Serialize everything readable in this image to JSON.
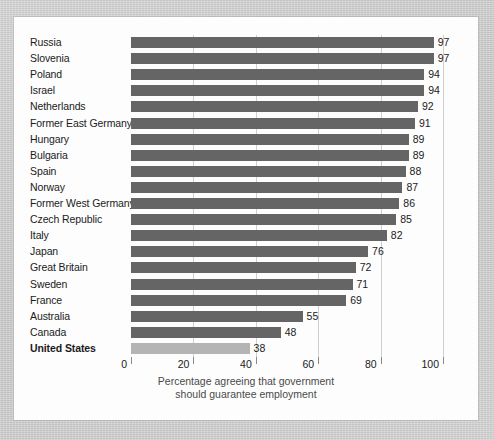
{
  "figure": {
    "background_color": "#c9c9c9",
    "panel_color": "#fdfdfd",
    "bar_color": "#656565",
    "highlight_bar_color": "#b4b4b4",
    "text_color": "#1b1b1b"
  },
  "chart_data": {
    "type": "bar",
    "orientation": "horizontal",
    "title": "",
    "subtitle": "",
    "xlabel_line1": "Percentage agreeing that government",
    "xlabel_line2": "should guarantee employment",
    "ylabel": "",
    "xlim": [
      0,
      100
    ],
    "xticks": [
      0,
      20,
      40,
      60,
      80,
      100
    ],
    "xtick_labels": [
      "0",
      "20",
      "40",
      "60",
      "80",
      "100"
    ],
    "grid": true,
    "legend": "none",
    "highlight_category": "United States",
    "categories": [
      "Russia",
      "Slovenia",
      "Poland",
      "Israel",
      "Netherlands",
      "Former East Germany",
      "Hungary",
      "Bulgaria",
      "Spain",
      "Norway",
      "Former West Germany",
      "Czech Republic",
      "Italy",
      "Japan",
      "Great Britain",
      "Sweden",
      "France",
      "Australia",
      "Canada",
      "United States"
    ],
    "values": [
      97,
      97,
      94,
      94,
      92,
      91,
      89,
      89,
      88,
      87,
      86,
      85,
      82,
      76,
      72,
      71,
      69,
      55,
      48,
      38
    ],
    "value_labels": [
      "97",
      "97",
      "94",
      "94",
      "92",
      "91",
      "89",
      "89",
      "88",
      "87",
      "86",
      "85",
      "82",
      "76",
      "72",
      "71",
      "69",
      "55",
      "48",
      "38"
    ]
  }
}
